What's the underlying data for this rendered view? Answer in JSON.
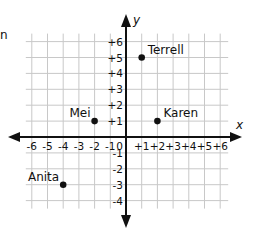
{
  "cut_off_text": "n",
  "chart_data": {
    "type": "scatter",
    "title": "",
    "xlabel": "x",
    "ylabel": "y",
    "xlim": [
      -6,
      6
    ],
    "ylim": [
      -4,
      6
    ],
    "grid": true,
    "x_tick_labels": [
      "-6",
      "-5",
      "-4",
      "-3",
      "-2",
      "-1",
      "0",
      "+1",
      "+2",
      "+3",
      "+4",
      "+5",
      "+6"
    ],
    "y_tick_labels": [
      "+6",
      "+5",
      "+4",
      "+3",
      "+2",
      "+1",
      "0",
      "-1",
      "-2",
      "-3",
      "-4"
    ],
    "points": [
      {
        "label": "Terrell",
        "x": 1,
        "y": 5
      },
      {
        "label": "Mei",
        "x": -2,
        "y": 1
      },
      {
        "label": "Karen",
        "x": 2,
        "y": 1
      },
      {
        "label": "Anita",
        "x": -4,
        "y": -3
      }
    ]
  },
  "colors": {
    "grid": "#c8c8c8",
    "axis": "#111111",
    "point": "#111111",
    "text": "#111111"
  }
}
